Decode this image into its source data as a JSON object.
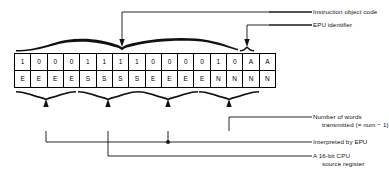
{
  "figure": {
    "bitfield": {
      "cell_count": 16,
      "row_top_name": "object-code-bits",
      "row_bottom_name": "field-type-bits",
      "row_top": [
        "1",
        "0",
        "0",
        "0",
        "1",
        "1",
        "1",
        "1",
        "0",
        "0",
        "0",
        "0",
        "1",
        "0",
        "A",
        "A"
      ],
      "row_bottom": [
        "E",
        "E",
        "E",
        "E",
        "S",
        "S",
        "S",
        "S",
        "E",
        "E",
        "E",
        "E",
        "N",
        "N",
        "N",
        "N"
      ]
    },
    "callouts": {
      "instruction_object_code": "Instruction object code",
      "epu_identifier": "EPU identifier",
      "number_of_words_line1": "Number of words",
      "number_of_words_line2": "transmitted (= num − 1)",
      "interpreted_by_epu": "Interpreted by EPU",
      "cpu_source_register_line1": "A 16-bit CPU",
      "cpu_source_register_line2": "source register"
    },
    "colors": {
      "ink": "#000000",
      "background": "#ffffff"
    }
  }
}
